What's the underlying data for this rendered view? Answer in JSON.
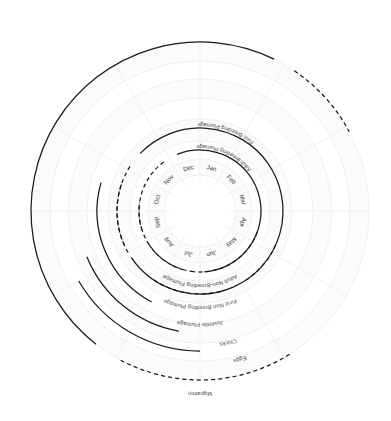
{
  "chart_data": {
    "type": "polar-timeline",
    "title": "",
    "subtitle": "",
    "xlabel": "",
    "ylabel": "",
    "grid": true,
    "legend_position": "none",
    "center": {
      "x": 200,
      "y": 211
    },
    "angular_axis": {
      "name": "Month of year",
      "start_angle_deg": -75,
      "direction": "clockwise",
      "tick_labels": [
        "Jan",
        "Feb",
        "Mar",
        "Apr",
        "May",
        "Jun",
        "Jul",
        "Aug",
        "Sep",
        "Oct",
        "Nov",
        "Dec"
      ],
      "tick_label_radius": 44
    },
    "radial_axis": {
      "name": "Life-stage ring",
      "rings": [
        {
          "name": "Adult Breeding Plumage",
          "radius": 61
        },
        {
          "name": "First Breeding Plumage",
          "radius": 83
        },
        {
          "name": "Adult Non-Breeding Plumage",
          "radius": 61
        },
        {
          "name": "First Non Breeding Plumage",
          "radius": 83
        },
        {
          "name": "Juvenile Plumage",
          "radius": 103
        },
        {
          "name": "Chicks",
          "radius": 122
        },
        {
          "name": "Eggs",
          "radius": 140
        },
        {
          "name": "Migration",
          "radius": 169
        }
      ]
    },
    "series": [
      {
        "name": "Adult Breeding Plumage",
        "label": "Adult Breeding Plumage",
        "radius": 61,
        "label_angle_deg": -66,
        "label_radius": 66,
        "segments": [
          {
            "from_deg": -112,
            "to_deg": 86,
            "style": "solid"
          },
          {
            "from_deg": 96,
            "to_deg": 150,
            "style": "dashed"
          },
          {
            "from_deg": 162,
            "to_deg": 236,
            "style": "dashed"
          }
        ]
      },
      {
        "name": "First Breeding Plumage",
        "label": "First Breeding Plumage",
        "radius": 83,
        "label_angle_deg": -72,
        "label_radius": 88,
        "segments": [
          {
            "from_deg": -136,
            "to_deg": 66,
            "style": "solid"
          },
          {
            "from_deg": 76,
            "to_deg": 124,
            "style": "dashed"
          },
          {
            "from_deg": 150,
            "to_deg": 214,
            "style": "dashed"
          }
        ]
      },
      {
        "name": "Adult Non-Breeding Plumage",
        "label": "Adult Non-Breeding Plumage",
        "radius": 61,
        "label_angle_deg": 90,
        "label_radius": 73,
        "segments": [
          {
            "from_deg": 20,
            "to_deg": 96,
            "style": "dashed"
          },
          {
            "from_deg": 106,
            "to_deg": 188,
            "style": "dashed"
          }
        ]
      },
      {
        "name": "First Non Breeding Plumage",
        "label": "First Non Breeding Plumage",
        "radius": 83,
        "label_angle_deg": 90,
        "label_radius": 95,
        "segments": [
          {
            "from_deg": 24,
            "to_deg": 58,
            "style": "dashed"
          },
          {
            "from_deg": 66,
            "to_deg": 146,
            "style": "solid"
          },
          {
            "from_deg": 156,
            "to_deg": 200,
            "style": "dashed"
          }
        ]
      },
      {
        "name": "Juvenile Plumage",
        "label": "Juvenile Plumage",
        "radius": 103,
        "label_angle_deg": 90,
        "label_radius": 112,
        "segments": [
          {
            "from_deg": 118,
            "to_deg": 196,
            "style": "solid"
          }
        ]
      },
      {
        "name": "Chicks",
        "label": "Chicks",
        "radius": 122,
        "label_angle_deg": 78,
        "label_radius": 133,
        "segments": [
          {
            "from_deg": 100,
            "to_deg": 158,
            "style": "solid"
          }
        ]
      },
      {
        "name": "Eggs",
        "label": "Eggs",
        "radius": 140,
        "label_angle_deg": 75,
        "label_radius": 152,
        "segments": [
          {
            "from_deg": 90,
            "to_deg": 150,
            "style": "solid"
          }
        ]
      },
      {
        "name": "Migration",
        "label": "Migration",
        "radius": 169,
        "label_angle_deg": 90,
        "label_radius": 181,
        "segments": [
          {
            "from_deg": 58,
            "to_deg": 118,
            "style": "dashed"
          },
          {
            "from_deg": 128,
            "to_deg": 296,
            "style": "solid"
          },
          {
            "from_deg": 304,
            "to_deg": 332,
            "style": "dashed"
          }
        ]
      }
    ],
    "colors": {
      "arc": "#1a1a1a",
      "grid": "#f0f0f0",
      "band": "#fbfbfb",
      "text": "#3f3f3f",
      "background": "#ffffff"
    }
  }
}
